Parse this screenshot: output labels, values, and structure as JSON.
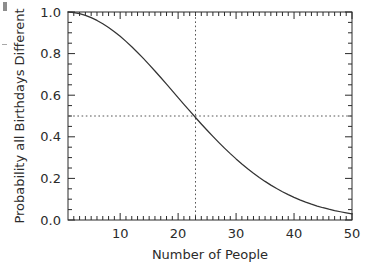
{
  "chart_data": {
    "type": "line",
    "title": "",
    "subtitle": "",
    "xlabel": "Number of People",
    "ylabel": "Probability all Birthdays Different",
    "xlim": [
      1,
      50
    ],
    "ylim": [
      0.0,
      1.0
    ],
    "grid": false,
    "legend": null,
    "x_ticks_major": [
      10,
      20,
      30,
      40,
      50
    ],
    "x_tick_labels": [
      "10",
      "20",
      "30",
      "40",
      "50"
    ],
    "x_minor_tick_interval": 1,
    "y_ticks_major": [
      0.0,
      0.2,
      0.4,
      0.6,
      0.8,
      1.0
    ],
    "y_tick_labels": [
      "0.0",
      "0.2",
      "0.4",
      "0.6",
      "0.8",
      "1.0"
    ],
    "y_minor_tick_interval": 0.05,
    "line_color": "#333333",
    "annotation_line_color": "#555555",
    "annotations": [
      {
        "kind": "vline",
        "x": 23,
        "style": "dotted",
        "label": "23 people"
      },
      {
        "kind": "hline",
        "y": 0.5,
        "style": "dotted",
        "label": "probability 0.5"
      }
    ],
    "x": [
      1,
      2,
      3,
      4,
      5,
      6,
      7,
      8,
      9,
      10,
      11,
      12,
      13,
      14,
      15,
      16,
      17,
      18,
      19,
      20,
      21,
      22,
      23,
      24,
      25,
      26,
      27,
      28,
      29,
      30,
      31,
      32,
      33,
      34,
      35,
      36,
      37,
      38,
      39,
      40,
      41,
      42,
      43,
      44,
      45,
      46,
      47,
      48,
      49,
      50
    ],
    "values": [
      1.0,
      0.9973,
      0.9918,
      0.9836,
      0.9729,
      0.9595,
      0.9438,
      0.9257,
      0.9054,
      0.8831,
      0.8589,
      0.833,
      0.8056,
      0.7769,
      0.7471,
      0.7164,
      0.685,
      0.6531,
      0.6209,
      0.5886,
      0.5563,
      0.5243,
      0.4927,
      0.4617,
      0.4313,
      0.4018,
      0.3731,
      0.3455,
      0.319,
      0.2937,
      0.2695,
      0.2465,
      0.2248,
      0.2043,
      0.1856,
      0.1678,
      0.1513,
      0.1359,
      0.1218,
      0.1088,
      0.0968,
      0.0859,
      0.076,
      0.0671,
      0.059,
      0.0518,
      0.0453,
      0.0396,
      0.0345,
      0.0296
    ]
  },
  "axis": {
    "x_title": "Number of People",
    "y_title": "Probability all Birthdays Different",
    "x_labels": [
      "10",
      "20",
      "30",
      "40",
      "50"
    ],
    "y_labels": [
      "1.0",
      "0.8",
      "0.6",
      "0.4",
      "0.2",
      "0.0"
    ]
  }
}
